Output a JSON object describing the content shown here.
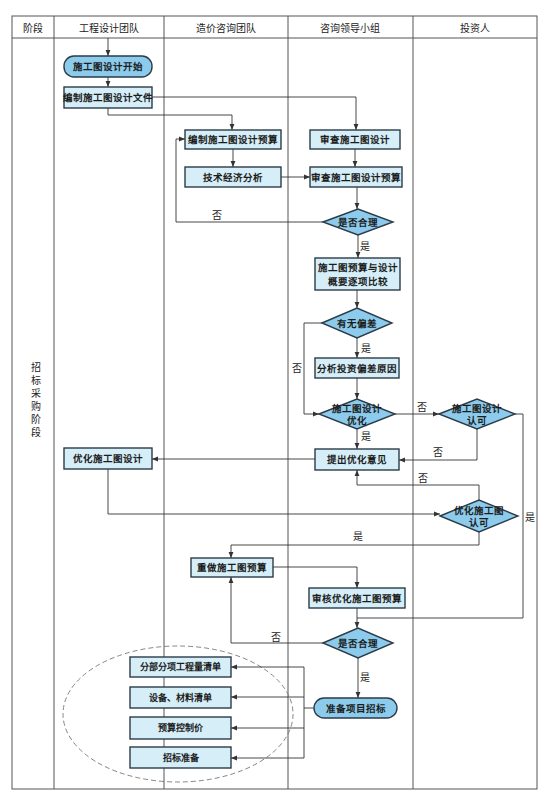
{
  "table": {
    "headers": [
      "阶段",
      "工程设计团队",
      "造价咨询团队",
      "咨询领导小组",
      "投资人"
    ],
    "stage": {
      "label": "招标采购阶段"
    }
  },
  "colors": {
    "box_fill": "#d5eef8",
    "terminal_fill": "#8ccbec",
    "diamond_fill": "#8ccbec",
    "stroke": "#2b3b48"
  },
  "flow": {
    "nodes": [
      {
        "type": "terminal",
        "lane": "工程设计团队",
        "label": "施工图设计开始"
      },
      {
        "type": "process",
        "lane": "工程设计团队",
        "label": "编制施工图设计文件"
      },
      {
        "type": "process",
        "lane": "造价咨询团队",
        "label": "编制施工图设计预算"
      },
      {
        "type": "process",
        "lane": "咨询领导小组",
        "label": "审查施工图设计"
      },
      {
        "type": "process",
        "lane": "造价咨询团队",
        "label": "技术经济分析"
      },
      {
        "type": "process",
        "lane": "咨询领导小组",
        "label": "审查施工图设计预算"
      },
      {
        "type": "decision",
        "lane": "咨询领导小组",
        "label": "是否合理"
      },
      {
        "type": "process",
        "lane": "咨询领导小组",
        "lines": [
          "施工图预算与设计",
          "概要逐项比较"
        ]
      },
      {
        "type": "decision",
        "lane": "咨询领导小组",
        "label": "有无偏差"
      },
      {
        "type": "process",
        "lane": "咨询领导小组",
        "label": "分析投资偏差原因"
      },
      {
        "type": "decision",
        "lane": "咨询领导小组",
        "lines": [
          "施工图设计",
          "优化"
        ]
      },
      {
        "type": "decision",
        "lane": "投资人",
        "lines": [
          "施工图设计",
          "认可"
        ]
      },
      {
        "type": "process",
        "lane": "咨询领导小组",
        "label": "提出优化意见"
      },
      {
        "type": "process",
        "lane": "工程设计团队",
        "label": "优化施工图设计"
      },
      {
        "type": "decision",
        "lane": "投资人",
        "lines": [
          "优化施工图",
          "认可"
        ]
      },
      {
        "type": "process",
        "lane": "造价咨询团队",
        "label": "重做施工图预算"
      },
      {
        "type": "process",
        "lane": "咨询领导小组",
        "label": "审核优化施工图预算"
      },
      {
        "type": "decision",
        "lane": "咨询领导小组",
        "label": "是否合理"
      },
      {
        "type": "terminal",
        "lane": "咨询领导小组",
        "label": "准备项目招标"
      },
      {
        "type": "process",
        "lane": "工程设计团队/造价咨询团队",
        "label": "分部分项工程量清单"
      },
      {
        "type": "process",
        "lane": "工程设计团队/造价咨询团队",
        "label": "设备、材料清单"
      },
      {
        "type": "process",
        "lane": "工程设计团队/造价咨询团队",
        "label": "预算控制价"
      },
      {
        "type": "process",
        "lane": "工程设计团队/造价咨询团队",
        "label": "招标准备"
      }
    ],
    "edge_labels": [
      "否",
      "是",
      "否",
      "是",
      "否",
      "是",
      "否",
      "否",
      "是",
      "是",
      "否",
      "是"
    ]
  }
}
